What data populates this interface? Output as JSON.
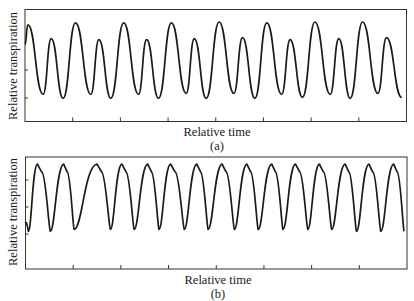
{
  "figure": {
    "panels": [
      {
        "id": "a",
        "panel_label": "(a)",
        "xlabel": "Relative time",
        "ylabel": "Relative transpiration"
      },
      {
        "id": "b",
        "panel_label": "(b)",
        "xlabel": "Relative time",
        "ylabel": "Relative transpiration"
      }
    ],
    "line_color": "#1a1a1a",
    "frame_color": "#333333"
  },
  "chart_data": [
    {
      "type": "line",
      "title": "(a)",
      "xlabel": "Relative time",
      "ylabel": "Relative transpiration",
      "grid": false,
      "legend": null,
      "x_tick_count": 7,
      "y_tick_count": 2,
      "tick_labels": false,
      "description": "Oscillating transpiration alternating between a large peak and a smaller peak (period-doubled oscillation)",
      "period_units": 1.0,
      "x_range": [
        0,
        8
      ],
      "y_range": [
        0,
        1
      ],
      "series": [
        {
          "name": "transpiration",
          "x": [
            0.0,
            0.06,
            0.38,
            0.55,
            0.8,
            1.06,
            1.38,
            1.55,
            1.8,
            2.07,
            2.38,
            2.55,
            2.8,
            3.07,
            3.38,
            3.55,
            3.8,
            4.07,
            4.38,
            4.56,
            4.82,
            5.07,
            5.38,
            5.56,
            5.82,
            6.08,
            6.4,
            6.58,
            6.82,
            7.08,
            7.4,
            7.58,
            7.9
          ],
          "y": [
            0.67,
            0.87,
            0.16,
            0.73,
            0.12,
            0.89,
            0.16,
            0.72,
            0.12,
            0.89,
            0.16,
            0.72,
            0.12,
            0.89,
            0.17,
            0.73,
            0.12,
            0.9,
            0.17,
            0.74,
            0.12,
            0.89,
            0.16,
            0.72,
            0.13,
            0.9,
            0.16,
            0.73,
            0.12,
            0.9,
            0.17,
            0.74,
            0.13
          ]
        }
      ]
    },
    {
      "type": "line",
      "title": "(b)",
      "xlabel": "Relative time",
      "ylabel": "Relative transpiration",
      "grid": false,
      "legend": null,
      "x_tick_count": 7,
      "y_tick_count": 3,
      "tick_labels": false,
      "description": "Relaxation-type oscillation: sharp rise to peak, shoulder, then gradual decline to sharp trough; ~11 cycles",
      "x_range": [
        0,
        8
      ],
      "y_range": [
        0,
        1
      ],
      "cycles": 11,
      "series": [
        {
          "name": "transpiration",
          "x": [
            0.0,
            0.06,
            0.25,
            0.52,
            0.8,
            1.02,
            1.5,
            1.78,
            2.02,
            2.28,
            2.56,
            2.8,
            3.04,
            3.33,
            3.59,
            3.83,
            4.12,
            4.38,
            4.64,
            4.88,
            5.16,
            5.4,
            5.66,
            5.92,
            6.16,
            6.42,
            6.7,
            6.94,
            7.2,
            7.45,
            7.72,
            7.94
          ],
          "y": [
            0.3,
            0.2,
            0.92,
            0.2,
            0.92,
            0.22,
            0.92,
            0.22,
            0.92,
            0.22,
            0.92,
            0.22,
            0.92,
            0.22,
            0.92,
            0.22,
            0.92,
            0.22,
            0.92,
            0.22,
            0.92,
            0.22,
            0.92,
            0.22,
            0.92,
            0.22,
            0.92,
            0.2,
            0.92,
            0.2,
            0.92,
            0.2
          ]
        }
      ]
    }
  ]
}
